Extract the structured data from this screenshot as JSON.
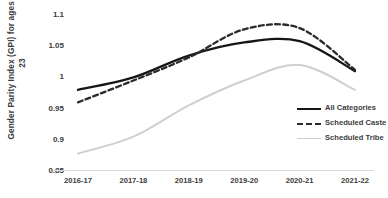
{
  "chart_data": {
    "type": "line",
    "title": "",
    "xlabel": "",
    "ylabel": "Gender Parity Index (GPI) for ages 18-23",
    "categories": [
      "2016-17",
      "2017-18",
      "2018-19",
      "2019-20",
      "2020-21",
      "2021-22"
    ],
    "ylim": [
      0.85,
      1.1
    ],
    "yticks": [
      "0.85",
      "0.9",
      "0.95",
      "1",
      "1.05",
      "1.1"
    ],
    "ytick_values": [
      0.85,
      0.9,
      0.95,
      1.0,
      1.05,
      1.1
    ],
    "grid": false,
    "legend_position": "right-inside",
    "series": [
      {
        "name": "All Categories",
        "style": "solid",
        "color": "#161616",
        "values": [
          0.98,
          1.0,
          1.035,
          1.056,
          1.058,
          1.01
        ]
      },
      {
        "name": "Scheduled Caste",
        "style": "dashed",
        "color": "#2b2b2b",
        "values": [
          0.96,
          0.995,
          1.032,
          1.077,
          1.079,
          1.012
        ]
      },
      {
        "name": "Scheduled Tribe",
        "style": "solid",
        "color": "#cfcfcf",
        "values": [
          0.878,
          0.905,
          0.955,
          0.995,
          1.02,
          0.98
        ]
      }
    ]
  },
  "axis": {
    "y_title": "Gender Parity Index (GPI) for ages 18-23"
  },
  "legend": {
    "items": [
      {
        "label": "All Categories"
      },
      {
        "label": "Scheduled Caste"
      },
      {
        "label": "Scheduled Tribe"
      }
    ]
  }
}
